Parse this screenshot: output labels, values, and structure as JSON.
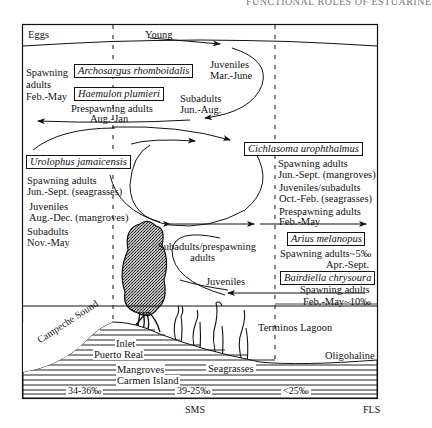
{
  "header": {
    "running_title": "FUNCTIONAL ROLES OF ESTUARINE"
  },
  "life_stages": {
    "left": "Eggs",
    "right": "Young"
  },
  "species": [
    {
      "name": "Archosargus rhomboidalis"
    },
    {
      "name": "Haemulon plumieri"
    },
    {
      "name": "Urolophus jamaicensis"
    },
    {
      "name": "Cichlasoma urophthalmus"
    },
    {
      "name": "Arius melanopus"
    },
    {
      "name": "Bairdiella chrysoura"
    }
  ],
  "labels": {
    "spawning_adults_1": "Spawning",
    "spawning_adults_2": "adults",
    "spawning_adults_3": "Feb.-May",
    "prespawning_1": "Prespawning adults",
    "prespawning_2": "Aug.-Jan",
    "juveniles_top_1": "Juveniles",
    "juveniles_top_2": "Mar.-June",
    "subadults_top_1": "Subadults",
    "subadults_top_2": "Jun.-Aug.",
    "uro_spawn_1": "Spawning adults",
    "uro_spawn_2": "Jun.-Sept. (seagrasses)",
    "uro_juv_1": "Juveniles",
    "uro_juv_2": "Aug.-Dec. (mangroves)",
    "uro_sub_1": "Subadults",
    "uro_sub_2": "Nov.-May",
    "cich_spawn_1": "Spawning adults",
    "cich_spawn_2": "Jun.-Sept. (mangroves)",
    "cich_juv_1": "Juveniles/subadults",
    "cich_juv_2": "Oct.-Feb. (seagrasses)",
    "cich_pre_1": "Prespawning adults",
    "cich_pre_2": "Feb.-May",
    "arius_1": "Spawning adults~5‰",
    "arius_2": "Apr.-Sept.",
    "bair_1": "Spawning adults",
    "bair_2": "Feb.-May~10‰",
    "subadults_pre_1": "Subadults/prespawning",
    "subadults_pre_2": "adults",
    "juveniles_bottom": "Juveniles"
  },
  "geography": {
    "campeche_sound": "Campeche Sound",
    "inlet": "Inlet",
    "puerto_real": "Puerto Real",
    "mangroves": "Mangroves",
    "carmen_island": "Carmen Island",
    "seagrasses": "Seagrasses",
    "terminos_lagoon": "Terminos Lagoon",
    "oligohaline": "Oligohaline"
  },
  "salinity": {
    "left": "34-36‰",
    "middle": "39-25‰",
    "right": "<25‰"
  },
  "zones": {
    "sms": "SMS",
    "fls": "FLS"
  }
}
